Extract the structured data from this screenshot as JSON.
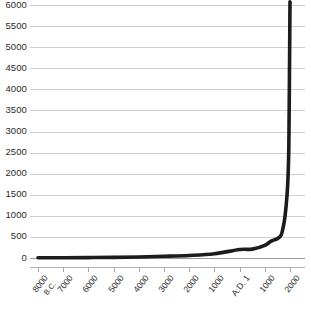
{
  "chart_data": {
    "type": "line",
    "title": "",
    "subtitle": "",
    "xlabel": "",
    "ylabel": "",
    "grid": true,
    "legend": false,
    "ylim": [
      0,
      6000
    ],
    "ytick_labels": [
      "6000",
      "5500",
      "5000",
      "4500",
      "4000",
      "3500",
      "3000",
      "2500",
      "2000",
      "1500",
      "1000",
      "500",
      "0"
    ],
    "ytick_values": [
      6000,
      5500,
      5000,
      4500,
      4000,
      3500,
      3000,
      2500,
      2000,
      1500,
      1000,
      500,
      0
    ],
    "xtick_labels": [
      "8000 B.C.",
      "7000",
      "6000",
      "5000",
      "4000",
      "3000",
      "2000",
      "1000",
      "A.D. 1",
      "1000",
      "2000"
    ],
    "xtick_label_main": [
      "8000",
      "7000",
      "6000",
      "5000",
      "4000",
      "3000",
      "2000",
      "1000",
      "A.D. 1",
      "1000",
      "2000"
    ],
    "xtick_label_sub": [
      "B.C.",
      "",
      "",
      "",
      "",
      "",
      "",
      "",
      "",
      "",
      ""
    ],
    "xtick_values": [
      -8000,
      -7000,
      -6000,
      -5000,
      -4000,
      -3000,
      -2000,
      -1000,
      1,
      1000,
      2000
    ],
    "series": [
      {
        "name": "World population",
        "x": [
          -8000,
          -7000,
          -6000,
          -5000,
          -4000,
          -3000,
          -2000,
          -1000,
          1,
          500,
          1000,
          1250,
          1500,
          1650,
          1750,
          1800,
          1850,
          1900,
          1927,
          1950,
          1960,
          1974,
          1987,
          1999,
          2000
        ],
        "values": [
          5,
          7,
          10,
          15,
          25,
          40,
          60,
          100,
          200,
          210,
          300,
          400,
          460,
          545,
          790,
          980,
          1260,
          1650,
          2000,
          2520,
          3020,
          4000,
          5000,
          6000,
          6000
        ]
      }
    ],
    "colors": {
      "line": "#1c1c1c",
      "grid": "#cfcfcf",
      "baseline": "#9a9a9a",
      "axis": "#b4b4b4",
      "text": "#2b2b2b",
      "background": "#ffffff"
    }
  }
}
